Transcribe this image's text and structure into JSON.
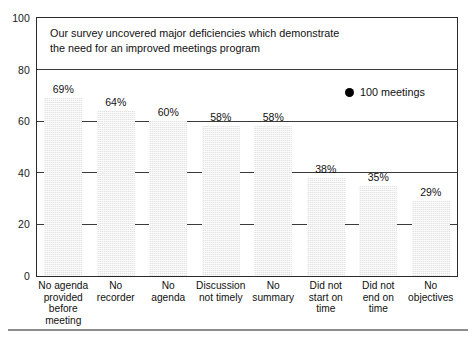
{
  "chart_data": {
    "type": "bar",
    "title_lines": [
      "Our survey uncovered major deficiencies which demonstrate",
      "the need for an improved meetings program"
    ],
    "categories": [
      "No agenda provided before meeting",
      "No recorder",
      "No agenda",
      "Discussion not timely",
      "No summary",
      "Did not start on time",
      "Did not end on time",
      "No objectives"
    ],
    "category_lines": [
      [
        "No agenda",
        "provided",
        "before",
        "meeting"
      ],
      [
        "No",
        "recorder"
      ],
      [
        "No",
        "agenda"
      ],
      [
        "Discussion",
        "not timely"
      ],
      [
        "No",
        "summary"
      ],
      [
        "Did not",
        "start on",
        "time"
      ],
      [
        "Did not",
        "end on",
        "time"
      ],
      [
        "No",
        "objectives"
      ]
    ],
    "values": [
      69,
      64,
      60,
      58,
      58,
      38,
      35,
      29
    ],
    "value_labels": [
      "69%",
      "64%",
      "60%",
      "58%",
      "58%",
      "38%",
      "35%",
      "29%"
    ],
    "xlabel": "",
    "ylabel": "",
    "ylim": [
      0,
      100
    ],
    "yticks": [
      0,
      20,
      40,
      60,
      80,
      100
    ],
    "ytick_labels": [
      "0",
      "20",
      "40",
      "60",
      "80",
      "100"
    ],
    "grid": true,
    "grid_axis": "y",
    "legend": {
      "position": "upper-right-inside",
      "entries": [
        {
          "marker": "filled-circle",
          "label": "100 meetings",
          "color": "#000000"
        }
      ]
    },
    "bar_color": "#e2e2e2",
    "axis_color": "#2b2b2b"
  }
}
